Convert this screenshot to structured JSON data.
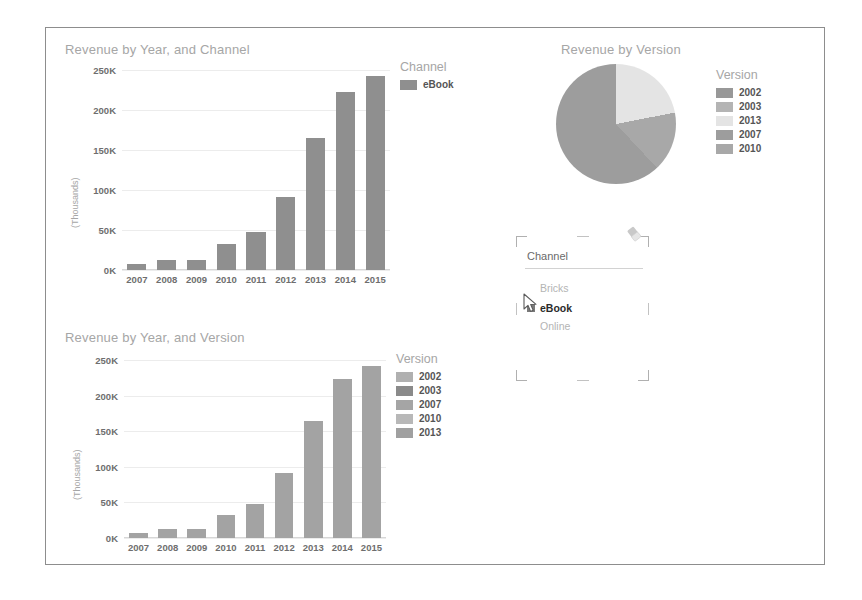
{
  "colors": {
    "bar_channel": "#8f8f8f",
    "bar_version": "#a3a3a3",
    "title_text": "#a6a6a6",
    "tick_text": "#6e6e6e",
    "gridline": "#ececec",
    "canvas_border": "#8d8d8d"
  },
  "charts": {
    "revenue_by_year_channel": {
      "title": "Revenue by Year, and Channel",
      "legend_title": "Channel",
      "legend_items": [
        {
          "label": "eBook",
          "color": "#8f8f8f"
        }
      ],
      "ylabel": "(Thousands)"
    },
    "revenue_by_version": {
      "title": "Revenue by Version",
      "legend_title": "Version",
      "legend_items": [
        {
          "label": "2002",
          "color": "#989898"
        },
        {
          "label": "2003",
          "color": "#b4b4b4"
        },
        {
          "label": "2013",
          "color": "#e4e4e4"
        },
        {
          "label": "2007",
          "color": "#9d9d9d"
        },
        {
          "label": "2010",
          "color": "#a8a8a8"
        }
      ]
    },
    "revenue_by_year_version": {
      "title": "Revenue by Year, and Version",
      "legend_title": "Version",
      "legend_items": [
        {
          "label": "2002",
          "color": "#b0b0b0"
        },
        {
          "label": "2003",
          "color": "#8a8a8a"
        },
        {
          "label": "2007",
          "color": "#a5a5a5"
        },
        {
          "label": "2010",
          "color": "#b8b8b8"
        },
        {
          "label": "2013",
          "color": "#a0a0a0"
        }
      ],
      "ylabel": "(Thousands)"
    }
  },
  "chart_data": [
    {
      "id": "revenue_by_year_channel",
      "type": "bar",
      "title": "Revenue by Year, and Channel",
      "xlabel": "",
      "ylabel": "(Thousands)",
      "categories": [
        "2007",
        "2008",
        "2009",
        "2010",
        "2011",
        "2012",
        "2013",
        "2014",
        "2015"
      ],
      "ytick_labels": [
        "0K",
        "50K",
        "100K",
        "150K",
        "200K",
        "250K"
      ],
      "ytick_values": [
        0,
        50000,
        100000,
        150000,
        200000,
        250000
      ],
      "ylim": [
        0,
        250000
      ],
      "grid": true,
      "legend_position": "right",
      "series": [
        {
          "name": "eBook",
          "color": "#8f8f8f",
          "values": [
            7000,
            12000,
            13000,
            32000,
            48000,
            91000,
            165000,
            223000,
            242000
          ]
        }
      ]
    },
    {
      "id": "revenue_by_version",
      "type": "pie",
      "title": "Revenue by Version",
      "legend_position": "right",
      "labels": [
        "2002",
        "2003",
        "2013",
        "2007",
        "2010"
      ],
      "slices": [
        {
          "label": "2013",
          "value": 22,
          "color": "#e4e4e4",
          "start_deg": 0,
          "end_deg": 79
        },
        {
          "label": "2010",
          "value": 16,
          "color": "#a8a8a8",
          "start_deg": 79,
          "end_deg": 137
        },
        {
          "label": "2007",
          "value": 62,
          "color": "#9d9d9d",
          "start_deg": 137,
          "end_deg": 360
        }
      ]
    },
    {
      "id": "revenue_by_year_version",
      "type": "bar",
      "title": "Revenue by Year, and Version",
      "xlabel": "",
      "ylabel": "(Thousands)",
      "categories": [
        "2007",
        "2008",
        "2009",
        "2010",
        "2011",
        "2012",
        "2013",
        "2014",
        "2015"
      ],
      "ytick_labels": [
        "0K",
        "50K",
        "100K",
        "150K",
        "200K",
        "250K"
      ],
      "ytick_values": [
        0,
        50000,
        100000,
        150000,
        200000,
        250000
      ],
      "ylim": [
        0,
        250000
      ],
      "grid": true,
      "legend_position": "right",
      "series": [
        {
          "name": "2013",
          "color": "#a3a3a3",
          "values": [
            7000,
            12000,
            13000,
            32000,
            48000,
            91000,
            165000,
            223000,
            242000
          ]
        }
      ]
    }
  ],
  "slicer": {
    "title": "Channel",
    "items": [
      {
        "label": "Bricks",
        "selected": false
      },
      {
        "label": "eBook",
        "selected": true
      },
      {
        "label": "Online",
        "selected": false
      }
    ],
    "clear_icon": "eraser-icon"
  }
}
